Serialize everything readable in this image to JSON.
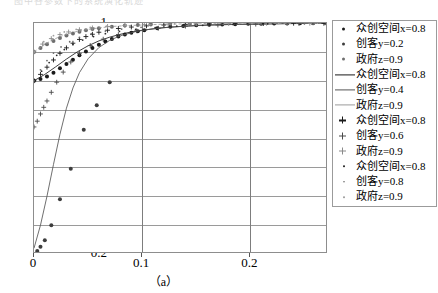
{
  "figure": {
    "caption": "（a）",
    "top_sliver_text": "图中各参数下的系统演化轨迹",
    "frame_color": "#8d8d8d"
  },
  "axes": {
    "y_ticks": [
      "1",
      "0.9",
      "0.8",
      "0.7",
      "0.6",
      "0.5",
      "0.4",
      "0.3",
      "0.2"
    ],
    "x_ticks": [
      "0",
      "0.1",
      "0.2"
    ]
  },
  "legend": {
    "entries": [
      {
        "marker": "dot",
        "color": "#1a1a1a",
        "label": "众创空间x=0.8"
      },
      {
        "marker": "dot",
        "color": "#3d3d3d",
        "label": "创客y=0.2"
      },
      {
        "marker": "dot",
        "color": "#6e6e6e",
        "label": "政府z=0.9"
      },
      {
        "marker": "line",
        "color": "#1a1a1a",
        "label": "众创空间x=0.8"
      },
      {
        "marker": "line",
        "color": "#555555",
        "label": "创客y=0.4"
      },
      {
        "marker": "line",
        "color": "#9a9a9a",
        "label": "政府z=0.9"
      },
      {
        "marker": "plus",
        "color": "#1a1a1a",
        "label": "众创空间x=0.8"
      },
      {
        "marker": "plus",
        "color": "#4a4a4a",
        "label": "创客y=0.6"
      },
      {
        "marker": "plus",
        "color": "#8a8a8a",
        "label": "政府z=0.9"
      },
      {
        "marker": "tinydot",
        "color": "#2a2a2a",
        "label": "众创空间x=0.8"
      },
      {
        "marker": "tinydot",
        "color": "#6a6a6a",
        "label": "创客y=0.8"
      },
      {
        "marker": "tinydot",
        "color": "#a0a0a0",
        "label": "政府z=0.9"
      }
    ]
  },
  "chart_data": {
    "type": "scatter",
    "title": "",
    "subtitle": "",
    "xlabel": "",
    "ylabel": "",
    "xlim": [
      0,
      0.2718
    ],
    "ylim": [
      0.2,
      1.0
    ],
    "x_ticks": [
      0,
      0.1,
      0.2
    ],
    "y_ticks": [
      0.2,
      0.3,
      0.4,
      0.5,
      0.6,
      0.7,
      0.8,
      0.9,
      1.0
    ],
    "grid": true,
    "legend_position": "right-outside",
    "annotations": [
      "（a）"
    ],
    "series": [
      {
        "name": "众创空间x=0.8",
        "marker": "dot",
        "color": "#1a1a1a",
        "x": [
          0.0,
          0.006,
          0.012,
          0.018,
          0.024,
          0.03,
          0.036,
          0.042,
          0.048,
          0.054,
          0.06,
          0.066,
          0.072,
          0.078,
          0.084,
          0.09,
          0.096,
          0.102,
          0.114,
          0.126,
          0.138,
          0.15,
          0.162,
          0.174,
          0.186,
          0.198,
          0.21,
          0.222,
          0.234,
          0.246,
          0.258,
          0.27
        ],
        "y": [
          0.8,
          0.806,
          0.815,
          0.828,
          0.843,
          0.858,
          0.873,
          0.888,
          0.901,
          0.913,
          0.925,
          0.936,
          0.945,
          0.953,
          0.96,
          0.966,
          0.971,
          0.975,
          0.982,
          0.987,
          0.99,
          0.992,
          0.994,
          0.995,
          0.996,
          0.997,
          0.997,
          0.998,
          0.998,
          0.999,
          0.999,
          0.999
        ]
      },
      {
        "name": "创客y=0.2",
        "marker": "dot",
        "color": "#3d3d3d",
        "x": [
          0.0,
          0.003,
          0.006,
          0.01,
          0.016,
          0.024,
          0.034,
          0.046,
          0.058,
          0.07
        ],
        "y": [
          0.2,
          0.21,
          0.225,
          0.248,
          0.3,
          0.39,
          0.495,
          0.63,
          0.715,
          0.795
        ]
      },
      {
        "name": "政府z=0.9",
        "marker": "dot",
        "color": "#6e6e6e",
        "x": [
          0.0,
          0.006,
          0.012,
          0.018,
          0.024,
          0.03,
          0.036,
          0.042,
          0.048,
          0.054,
          0.06,
          0.072,
          0.084,
          0.096,
          0.108,
          0.126,
          0.144,
          0.162,
          0.186,
          0.21,
          0.234,
          0.258,
          0.27
        ],
        "y": [
          0.9,
          0.913,
          0.926,
          0.938,
          0.948,
          0.957,
          0.964,
          0.97,
          0.975,
          0.979,
          0.982,
          0.987,
          0.991,
          0.993,
          0.995,
          0.997,
          0.998,
          0.998,
          0.999,
          0.999,
          0.999,
          1.0,
          1.0
        ]
      },
      {
        "name": "众创空间x=0.8 (line)",
        "marker": "line",
        "color": "#1a1a1a",
        "x": [
          0.0,
          0.01,
          0.02,
          0.03,
          0.04,
          0.05,
          0.06,
          0.07,
          0.08,
          0.09,
          0.1,
          0.12,
          0.14,
          0.16,
          0.18,
          0.2,
          0.22,
          0.24,
          0.26,
          0.272
        ],
        "y": [
          0.8,
          0.822,
          0.848,
          0.875,
          0.9,
          0.921,
          0.938,
          0.951,
          0.961,
          0.969,
          0.975,
          0.984,
          0.989,
          0.993,
          0.995,
          0.996,
          0.997,
          0.998,
          0.999,
          0.999
        ]
      },
      {
        "name": "创客y=0.4 (line)",
        "marker": "line",
        "color": "#555555",
        "x": [
          0.0,
          0.006,
          0.012,
          0.018,
          0.024,
          0.03,
          0.036,
          0.042,
          0.05,
          0.06,
          0.07,
          0.08,
          0.095,
          0.11,
          0.13,
          0.15,
          0.175,
          0.2,
          0.23,
          0.26,
          0.272
        ],
        "y": [
          0.22,
          0.3,
          0.4,
          0.51,
          0.615,
          0.705,
          0.775,
          0.828,
          0.876,
          0.915,
          0.94,
          0.956,
          0.971,
          0.98,
          0.987,
          0.991,
          0.994,
          0.996,
          0.998,
          0.999,
          0.999
        ]
      },
      {
        "name": "政府z=0.9 (line)",
        "marker": "line",
        "color": "#9a9a9a",
        "x": [
          0.0,
          0.008,
          0.016,
          0.024,
          0.032,
          0.04,
          0.05,
          0.06,
          0.072,
          0.086,
          0.1,
          0.12,
          0.145,
          0.17,
          0.2,
          0.235,
          0.272
        ],
        "y": [
          0.9,
          0.921,
          0.939,
          0.953,
          0.963,
          0.971,
          0.978,
          0.983,
          0.988,
          0.991,
          0.993,
          0.996,
          0.997,
          0.998,
          0.999,
          0.999,
          1.0
        ]
      },
      {
        "name": "众创空间x=0.8 (plus)",
        "marker": "plus",
        "color": "#1a1a1a",
        "x": [
          0.0,
          0.006,
          0.012,
          0.018,
          0.024,
          0.03,
          0.036,
          0.042,
          0.048,
          0.054,
          0.06,
          0.068,
          0.078,
          0.09,
          0.104,
          0.12,
          0.14,
          0.162,
          0.186,
          0.212,
          0.24,
          0.268
        ],
        "y": [
          0.8,
          0.822,
          0.847,
          0.872,
          0.895,
          0.914,
          0.93,
          0.943,
          0.953,
          0.961,
          0.968,
          0.975,
          0.981,
          0.986,
          0.99,
          0.993,
          0.995,
          0.997,
          0.998,
          0.998,
          0.999,
          0.999
        ]
      },
      {
        "name": "创客y=0.6 (plus)",
        "marker": "plus",
        "color": "#4a4a4a",
        "x": [
          0.0,
          0.003,
          0.006,
          0.009,
          0.012,
          0.016,
          0.021,
          0.027,
          0.034,
          0.042,
          0.052,
          0.064,
          0.078,
          0.095,
          0.115,
          0.14,
          0.17,
          0.205,
          0.245,
          0.272
        ],
        "y": [
          0.64,
          0.66,
          0.685,
          0.708,
          0.73,
          0.76,
          0.795,
          0.83,
          0.865,
          0.895,
          0.922,
          0.944,
          0.96,
          0.973,
          0.982,
          0.989,
          0.993,
          0.996,
          0.998,
          0.999
        ]
      },
      {
        "name": "政府z=0.9 (plus)",
        "marker": "plus",
        "color": "#8a8a8a",
        "x": [
          0.0,
          0.008,
          0.016,
          0.024,
          0.032,
          0.042,
          0.054,
          0.068,
          0.084,
          0.102,
          0.124,
          0.15,
          0.18,
          0.215,
          0.255,
          0.272
        ],
        "y": [
          0.9,
          0.927,
          0.946,
          0.96,
          0.969,
          0.977,
          0.983,
          0.988,
          0.991,
          0.994,
          0.996,
          0.997,
          0.998,
          0.999,
          0.999,
          1.0
        ]
      },
      {
        "name": "众创空间x=0.8 (tinydot)",
        "marker": "tinydot",
        "color": "#2a2a2a",
        "x": [
          0.0,
          0.007,
          0.014,
          0.021,
          0.028,
          0.036,
          0.045,
          0.055,
          0.066,
          0.079,
          0.094,
          0.112,
          0.132,
          0.156,
          0.184,
          0.216,
          0.25,
          0.272
        ],
        "y": [
          0.8,
          0.833,
          0.863,
          0.888,
          0.908,
          0.926,
          0.941,
          0.953,
          0.963,
          0.971,
          0.978,
          0.984,
          0.989,
          0.992,
          0.995,
          0.997,
          0.998,
          0.999
        ]
      },
      {
        "name": "创客y=0.8 (tinydot)",
        "marker": "tinydot",
        "color": "#6a6a6a",
        "x": [
          0.0,
          0.006,
          0.012,
          0.018,
          0.025,
          0.033,
          0.042,
          0.053,
          0.066,
          0.081,
          0.099,
          0.12,
          0.145,
          0.175,
          0.21,
          0.25,
          0.272
        ],
        "y": [
          0.8,
          0.838,
          0.87,
          0.896,
          0.917,
          0.935,
          0.95,
          0.962,
          0.972,
          0.979,
          0.985,
          0.99,
          0.993,
          0.996,
          0.997,
          0.998,
          0.999
        ]
      },
      {
        "name": "政府z=0.9 (tinydot)",
        "marker": "tinydot",
        "color": "#a0a0a0",
        "x": [
          0.0,
          0.009,
          0.018,
          0.028,
          0.039,
          0.052,
          0.067,
          0.085,
          0.106,
          0.13,
          0.158,
          0.19,
          0.226,
          0.262,
          0.272
        ],
        "y": [
          0.9,
          0.935,
          0.956,
          0.969,
          0.978,
          0.985,
          0.989,
          0.993,
          0.995,
          0.997,
          0.998,
          0.999,
          0.999,
          1.0,
          1.0
        ]
      }
    ]
  }
}
